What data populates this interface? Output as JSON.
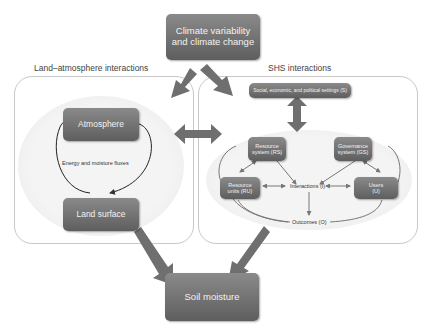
{
  "top": {
    "title_line1": "Climate variability",
    "title_line2": "and climate change"
  },
  "left_panel": {
    "title": "Land–atmosphere interactions",
    "atmosphere": "Atmosphere",
    "land_surface": "Land surface",
    "flux_label": "Energy and moisture fluxes"
  },
  "right_panel": {
    "title": "SHS interactions",
    "settings": "Social, economic, and political settings (S)",
    "resource_system_l1": "Resource",
    "resource_system_l2": "system (RS)",
    "governance_l1": "Governance",
    "governance_l2": "system (GS)",
    "resource_units_l1": "Resource",
    "resource_units_l2": "units (RU)",
    "users_l1": "Users",
    "users_l2": "(U)",
    "interactions": "Interactions (I)",
    "outcomes": "Outcomes (O)"
  },
  "bottom": {
    "title": "Soil moisture"
  },
  "colors": {
    "box_top": "#8a8a8a",
    "box_bottom": "#5e5e5e",
    "arrow": "#6f6f6f",
    "panel_border": "#c8c8c8"
  }
}
